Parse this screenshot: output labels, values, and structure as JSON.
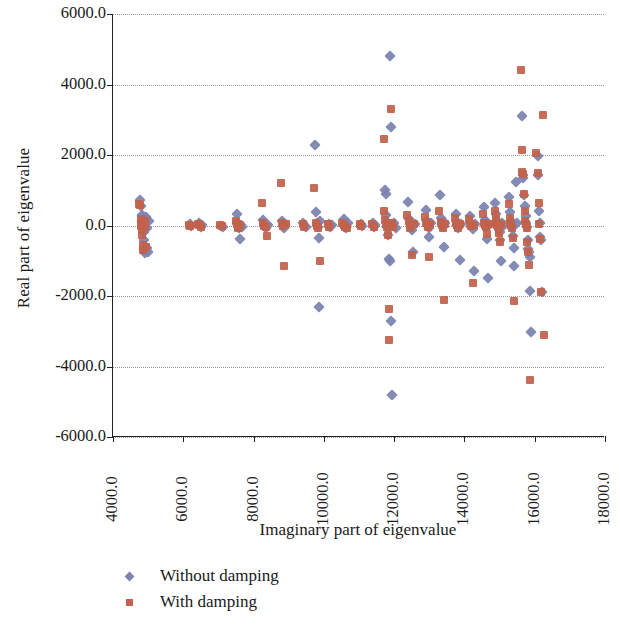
{
  "chart_data": {
    "type": "scatter",
    "title": "",
    "xlabel": "Imaginary part of eigenvalue",
    "ylabel": "Real part of eigenvalue",
    "xlim": [
      4000,
      18000
    ],
    "ylim": [
      -6000,
      6000
    ],
    "xticks": [
      "4000.0",
      "6000.0",
      "8000.0",
      "10000.0",
      "12000.0",
      "14000.0",
      "16000.0",
      "18000.0"
    ],
    "xtick_values": [
      4000,
      6000,
      8000,
      10000,
      12000,
      14000,
      16000,
      18000
    ],
    "yticks": [
      "6000.0",
      "4000.0",
      "2000.0",
      "0.0",
      "-2000.0",
      "-4000.0",
      "-6000.0"
    ],
    "ytick_values": [
      6000,
      4000,
      2000,
      0,
      -2000,
      -4000,
      -6000
    ],
    "grid": "horizontal-dotted",
    "legend_position": "below-left",
    "series": [
      {
        "name": "Without damping",
        "marker": "diamond",
        "color": "#7b83b0",
        "points": [
          [
            4760,
            730
          ],
          [
            4800,
            560
          ],
          [
            4820,
            300
          ],
          [
            4830,
            120
          ],
          [
            4850,
            60
          ],
          [
            4860,
            -40
          ],
          [
            4870,
            -180
          ],
          [
            4880,
            -420
          ],
          [
            4890,
            -660
          ],
          [
            4900,
            -780
          ],
          [
            4910,
            -700
          ],
          [
            4930,
            180
          ],
          [
            4950,
            250
          ],
          [
            4960,
            -60
          ],
          [
            4980,
            -650
          ],
          [
            5000,
            -740
          ],
          [
            5020,
            140
          ],
          [
            6180,
            30
          ],
          [
            6220,
            -20
          ],
          [
            6450,
            60
          ],
          [
            6480,
            20
          ],
          [
            6500,
            -40
          ],
          [
            6530,
            10
          ],
          [
            7080,
            0
          ],
          [
            7120,
            -30
          ],
          [
            7520,
            340
          ],
          [
            7540,
            60
          ],
          [
            7560,
            -10
          ],
          [
            7580,
            -60
          ],
          [
            7600,
            -380
          ],
          [
            7640,
            10
          ],
          [
            7680,
            -30
          ],
          [
            8260,
            160
          ],
          [
            8300,
            20
          ],
          [
            8320,
            -30
          ],
          [
            8360,
            -60
          ],
          [
            8400,
            10
          ],
          [
            8800,
            120
          ],
          [
            8830,
            -20
          ],
          [
            8860,
            -60
          ],
          [
            8900,
            30
          ],
          [
            9420,
            60
          ],
          [
            9450,
            -20
          ],
          [
            9480,
            -50
          ],
          [
            9760,
            2290
          ],
          [
            9790,
            380
          ],
          [
            9810,
            60
          ],
          [
            9830,
            -30
          ],
          [
            9850,
            -350
          ],
          [
            9870,
            -2300
          ],
          [
            9900,
            130
          ],
          [
            10150,
            50
          ],
          [
            10180,
            -40
          ],
          [
            10220,
            20
          ],
          [
            10560,
            180
          ],
          [
            10590,
            40
          ],
          [
            10610,
            -30
          ],
          [
            10640,
            -80
          ],
          [
            10680,
            60
          ],
          [
            11050,
            30
          ],
          [
            11080,
            -20
          ],
          [
            11400,
            60
          ],
          [
            11430,
            -40
          ],
          [
            11460,
            20
          ],
          [
            11740,
            1000
          ],
          [
            11760,
            900
          ],
          [
            11780,
            300
          ],
          [
            11800,
            60
          ],
          [
            11810,
            -40
          ],
          [
            11830,
            -280
          ],
          [
            11850,
            -960
          ],
          [
            11870,
            -1020
          ],
          [
            11880,
            4820
          ],
          [
            11900,
            2800
          ],
          [
            11920,
            -2720
          ],
          [
            11950,
            -4800
          ],
          [
            12000,
            80
          ],
          [
            12050,
            -60
          ],
          [
            12400,
            660
          ],
          [
            12430,
            180
          ],
          [
            12450,
            40
          ],
          [
            12470,
            -40
          ],
          [
            12500,
            -120
          ],
          [
            12540,
            -760
          ],
          [
            12580,
            30
          ],
          [
            12900,
            430
          ],
          [
            12930,
            120
          ],
          [
            12950,
            20
          ],
          [
            12980,
            -60
          ],
          [
            13000,
            -340
          ],
          [
            13040,
            60
          ],
          [
            13300,
            860
          ],
          [
            13330,
            220
          ],
          [
            13360,
            40
          ],
          [
            13390,
            -30
          ],
          [
            13420,
            -620
          ],
          [
            13460,
            70
          ],
          [
            13750,
            330
          ],
          [
            13780,
            100
          ],
          [
            13800,
            10
          ],
          [
            13830,
            -60
          ],
          [
            13860,
            -980
          ],
          [
            13900,
            40
          ],
          [
            14150,
            260
          ],
          [
            14180,
            60
          ],
          [
            14210,
            -20
          ],
          [
            14240,
            -90
          ],
          [
            14270,
            -1280
          ],
          [
            14300,
            30
          ],
          [
            14560,
            520
          ],
          [
            14580,
            160
          ],
          [
            14600,
            50
          ],
          [
            14620,
            -30
          ],
          [
            14650,
            -380
          ],
          [
            14680,
            -1500
          ],
          [
            14700,
            20
          ],
          [
            14880,
            640
          ],
          [
            14900,
            340
          ],
          [
            14920,
            120
          ],
          [
            14940,
            40
          ],
          [
            14960,
            -20
          ],
          [
            14980,
            -80
          ],
          [
            15000,
            -180
          ],
          [
            15020,
            -420
          ],
          [
            15040,
            -1020
          ],
          [
            15060,
            60
          ],
          [
            15080,
            -40
          ],
          [
            15280,
            800
          ],
          [
            15300,
            380
          ],
          [
            15320,
            120
          ],
          [
            15340,
            30
          ],
          [
            15360,
            -60
          ],
          [
            15380,
            -300
          ],
          [
            15400,
            -640
          ],
          [
            15420,
            -1140
          ],
          [
            15480,
            1220
          ],
          [
            15500,
            60
          ],
          [
            15640,
            3100
          ],
          [
            15660,
            1420
          ],
          [
            15680,
            1360
          ],
          [
            15700,
            860
          ],
          [
            15720,
            540
          ],
          [
            15740,
            260
          ],
          [
            15760,
            60
          ],
          [
            15780,
            -40
          ],
          [
            15800,
            -420
          ],
          [
            15820,
            -660
          ],
          [
            15840,
            -760
          ],
          [
            15860,
            -880
          ],
          [
            15880,
            -1860
          ],
          [
            15900,
            -3020
          ],
          [
            16080,
            1960
          ],
          [
            16100,
            1440
          ],
          [
            16120,
            400
          ],
          [
            16140,
            60
          ],
          [
            16160,
            -340
          ],
          [
            16180,
            -420
          ],
          [
            16200,
            -1880
          ]
        ]
      },
      {
        "name": "With damping",
        "marker": "square",
        "color": "#c2624c",
        "points": [
          [
            4730,
            600
          ],
          [
            4760,
            580
          ],
          [
            4790,
            180
          ],
          [
            4800,
            40
          ],
          [
            4810,
            -20
          ],
          [
            4820,
            -120
          ],
          [
            4830,
            -260
          ],
          [
            4840,
            -560
          ],
          [
            4860,
            -700
          ],
          [
            4880,
            60
          ],
          [
            4900,
            -40
          ],
          [
            4920,
            120
          ],
          [
            4950,
            -620
          ],
          [
            6150,
            20
          ],
          [
            6200,
            -10
          ],
          [
            6420,
            40
          ],
          [
            6460,
            10
          ],
          [
            6490,
            -30
          ],
          [
            7050,
            10
          ],
          [
            7100,
            -20
          ],
          [
            7500,
            120
          ],
          [
            7530,
            30
          ],
          [
            7550,
            -20
          ],
          [
            7570,
            -60
          ],
          [
            7620,
            20
          ],
          [
            8230,
            640
          ],
          [
            8270,
            60
          ],
          [
            8300,
            -10
          ],
          [
            8340,
            -50
          ],
          [
            8380,
            -300
          ],
          [
            8780,
            1200
          ],
          [
            8810,
            60
          ],
          [
            8840,
            -20
          ],
          [
            8870,
            -1150
          ],
          [
            8920,
            40
          ],
          [
            9400,
            30
          ],
          [
            9440,
            -40
          ],
          [
            9730,
            1060
          ],
          [
            9780,
            80
          ],
          [
            9800,
            -20
          ],
          [
            9840,
            -60
          ],
          [
            9880,
            -1000
          ],
          [
            10120,
            40
          ],
          [
            10160,
            -30
          ],
          [
            10530,
            60
          ],
          [
            10570,
            20
          ],
          [
            10600,
            -40
          ],
          [
            10660,
            -80
          ],
          [
            11020,
            30
          ],
          [
            11060,
            -20
          ],
          [
            11380,
            40
          ],
          [
            11420,
            -30
          ],
          [
            11700,
            2450
          ],
          [
            11720,
            420
          ],
          [
            11740,
            160
          ],
          [
            11760,
            40
          ],
          [
            11790,
            -40
          ],
          [
            11820,
            -260
          ],
          [
            11840,
            -2380
          ],
          [
            11860,
            -3240
          ],
          [
            11900,
            3300
          ],
          [
            11930,
            60
          ],
          [
            11970,
            -40
          ],
          [
            12380,
            300
          ],
          [
            12420,
            120
          ],
          [
            12440,
            20
          ],
          [
            12460,
            -60
          ],
          [
            12520,
            -840
          ],
          [
            12560,
            40
          ],
          [
            12880,
            240
          ],
          [
            12920,
            60
          ],
          [
            12960,
            -30
          ],
          [
            12990,
            -880
          ],
          [
            13020,
            30
          ],
          [
            13280,
            400
          ],
          [
            13320,
            100
          ],
          [
            13350,
            20
          ],
          [
            13380,
            -60
          ],
          [
            13410,
            -2120
          ],
          [
            13450,
            40
          ],
          [
            13720,
            200
          ],
          [
            13760,
            60
          ],
          [
            13790,
            10
          ],
          [
            13820,
            -80
          ],
          [
            13880,
            30
          ],
          [
            14120,
            180
          ],
          [
            14160,
            40
          ],
          [
            14200,
            -20
          ],
          [
            14230,
            -1640
          ],
          [
            14280,
            20
          ],
          [
            14540,
            340
          ],
          [
            14570,
            80
          ],
          [
            14590,
            20
          ],
          [
            14610,
            -40
          ],
          [
            14640,
            -240
          ],
          [
            14690,
            30
          ],
          [
            14860,
            420
          ],
          [
            14890,
            180
          ],
          [
            14910,
            60
          ],
          [
            14930,
            20
          ],
          [
            14950,
            -30
          ],
          [
            14970,
            -90
          ],
          [
            14990,
            -200
          ],
          [
            15010,
            -480
          ],
          [
            15050,
            40
          ],
          [
            15260,
            600
          ],
          [
            15290,
            200
          ],
          [
            15310,
            60
          ],
          [
            15330,
            20
          ],
          [
            15350,
            -80
          ],
          [
            15370,
            -360
          ],
          [
            15410,
            -2140
          ],
          [
            15600,
            4400
          ],
          [
            15630,
            2140
          ],
          [
            15650,
            1520
          ],
          [
            15670,
            1460
          ],
          [
            15690,
            900
          ],
          [
            15710,
            420
          ],
          [
            15730,
            120
          ],
          [
            15750,
            40
          ],
          [
            15770,
            -60
          ],
          [
            15790,
            -480
          ],
          [
            15810,
            -740
          ],
          [
            15830,
            -1120
          ],
          [
            15870,
            -4380
          ],
          [
            16050,
            2060
          ],
          [
            16080,
            1480
          ],
          [
            16110,
            640
          ],
          [
            16130,
            40
          ],
          [
            16160,
            -380
          ],
          [
            16190,
            -1900
          ],
          [
            16230,
            3140
          ],
          [
            16260,
            -3100
          ]
        ]
      }
    ]
  },
  "legend": {
    "items": [
      {
        "label": "Without damping",
        "marker": "diamond"
      },
      {
        "label": "With damping",
        "marker": "square"
      }
    ]
  }
}
